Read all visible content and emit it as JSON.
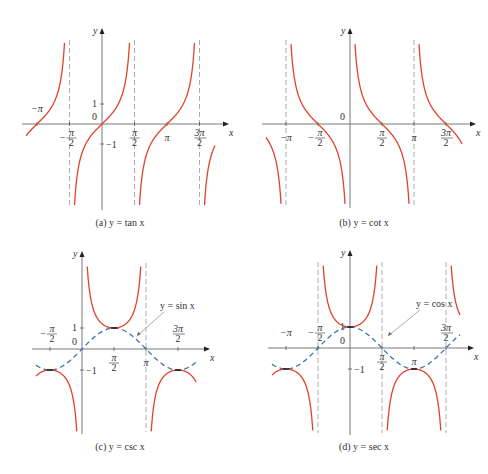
{
  "colors": {
    "curve": "#e0432a",
    "dashed_curve": "#3a6fb0",
    "axis": "#555555",
    "asymptote": "#999999",
    "extremum_mark": "#222222"
  },
  "panels": [
    {
      "id": "a",
      "caption": "(a) y = tan x",
      "func": "tan",
      "origin": [
        102,
        124
      ],
      "unit_x_half_pi": 32.5,
      "unit_y": 20,
      "x_range_px": [
        26,
        215
      ],
      "y_top": 40,
      "y_bottom": 208,
      "asymptotes": [
        -1.5708,
        1.5708,
        4.7124
      ],
      "x_ticks": [
        {
          "label": "−π",
          "x": -3.1416,
          "pos": "above"
        },
        {
          "label": "−π/2",
          "x": -1.5708,
          "pos": "below"
        },
        {
          "label": "π/2",
          "x": 1.5708,
          "pos": "below"
        },
        {
          "label": "π",
          "x": 3.1416,
          "pos": "below"
        },
        {
          "label": "3π/2",
          "x": 4.7124,
          "pos": "below"
        }
      ],
      "y_ticks": [
        {
          "label": "1",
          "y": 1
        },
        {
          "label": "−1",
          "y": -1
        }
      ],
      "zero_label": "0",
      "axis_labels": {
        "x": "x",
        "y": "y"
      },
      "caption_pos": [
        120,
        226
      ]
    },
    {
      "id": "b",
      "caption": "(b) y = cot x",
      "func": "cot",
      "origin": [
        350,
        124
      ],
      "unit_x_half_pi": 32,
      "unit_y": 20,
      "x_range_px": [
        266,
        462
      ],
      "y_top": 40,
      "y_bottom": 206,
      "asymptotes": [
        -3.1416,
        3.1416
      ],
      "x_ticks": [
        {
          "label": "−π",
          "x": -3.1416,
          "pos": "below"
        },
        {
          "label": "−π/2",
          "x": -1.5708,
          "pos": "below"
        },
        {
          "label": "π/2",
          "x": 1.5708,
          "pos": "below"
        },
        {
          "label": "π",
          "x": 3.1416,
          "pos": "below"
        },
        {
          "label": "3π/2",
          "x": 4.7124,
          "pos": "below"
        }
      ],
      "y_ticks": [],
      "zero_label": "0",
      "axis_labels": {
        "x": "x",
        "y": "y"
      },
      "caption_pos": [
        364,
        226
      ]
    },
    {
      "id": "c",
      "caption": "(c) y = csc x",
      "func": "csc",
      "companion": {
        "func": "sin",
        "label": "y = sin x"
      },
      "origin": [
        82,
        349
      ],
      "unit_x_half_pi": 32,
      "unit_y": 21,
      "x_range_px": [
        36,
        196
      ],
      "y_top": 263,
      "y_bottom": 432,
      "asymptotes": [
        3.1416
      ],
      "x_ticks": [
        {
          "label": "−π/2",
          "x": -1.5708,
          "pos": "above"
        },
        {
          "label": "π/2",
          "x": 1.5708,
          "pos": "below"
        },
        {
          "label": "π",
          "x": 3.1416,
          "pos": "below"
        },
        {
          "label": "3π/2",
          "x": 4.7124,
          "pos": "above"
        }
      ],
      "y_ticks": [
        {
          "label": "1",
          "y": 1
        },
        {
          "label": "−1",
          "y": -1
        }
      ],
      "zero_label": "0",
      "axis_labels": {
        "x": "x",
        "y": "y"
      },
      "caption_pos": [
        120,
        450
      ]
    },
    {
      "id": "d",
      "caption": "(d) y = sec x",
      "func": "sec",
      "companion": {
        "func": "cos",
        "label": "y = cos x"
      },
      "origin": [
        350,
        348
      ],
      "unit_x_half_pi": 32,
      "unit_y": 21,
      "x_range_px": [
        272,
        460
      ],
      "y_top": 262,
      "y_bottom": 433,
      "asymptotes": [
        -1.5708,
        1.5708,
        4.7124
      ],
      "x_ticks": [
        {
          "label": "−π",
          "x": -3.1416,
          "pos": "above"
        },
        {
          "label": "−π/2",
          "x": -1.5708,
          "pos": "above"
        },
        {
          "label": "π/2",
          "x": 1.5708,
          "pos": "below"
        },
        {
          "label": "π",
          "x": 3.1416,
          "pos": "below"
        },
        {
          "label": "3π/2",
          "x": 4.7124,
          "pos": "above"
        }
      ],
      "y_ticks": [
        {
          "label": "1",
          "y": 1
        },
        {
          "label": "−1",
          "y": -1
        }
      ],
      "zero_label": "0",
      "axis_labels": {
        "x": "x",
        "y": "y"
      },
      "caption_pos": [
        364,
        450
      ]
    }
  ],
  "chart_data": [
    {
      "type": "line",
      "title": "(a) y = tan x",
      "xlabel": "x",
      "ylabel": "y",
      "series": [
        {
          "name": "tan x",
          "x": [
            -3.1416,
            -0.7854,
            0,
            0.7854,
            3.1416
          ],
          "values": [
            0,
            -1,
            0,
            1,
            0
          ]
        }
      ],
      "asymptotes_x": [
        "−π/2",
        "π/2",
        "3π/2"
      ],
      "x_tick_labels": [
        "−π",
        "−π/2",
        "π/2",
        "π",
        "3π/2"
      ],
      "y_tick_labels": [
        "1",
        "−1"
      ],
      "grid": false
    },
    {
      "type": "line",
      "title": "(b) y = cot x",
      "xlabel": "x",
      "ylabel": "y",
      "series": [
        {
          "name": "cot x",
          "x": [
            -1.5708,
            1.5708,
            4.7124
          ],
          "values": [
            0,
            0,
            0
          ]
        }
      ],
      "asymptotes_x": [
        "−π",
        "0",
        "π"
      ],
      "x_tick_labels": [
        "−π",
        "−π/2",
        "π/2",
        "π",
        "3π/2"
      ],
      "grid": false
    },
    {
      "type": "line",
      "title": "(c) y = csc x",
      "xlabel": "x",
      "ylabel": "y",
      "series": [
        {
          "name": "csc x",
          "x": [
            -1.5708,
            1.5708,
            4.7124
          ],
          "values": [
            -1,
            1,
            -1
          ]
        },
        {
          "name": "y = sin x (dashed)",
          "x": [
            -1.5708,
            0,
            1.5708,
            3.1416,
            4.7124
          ],
          "values": [
            -1,
            0,
            1,
            0,
            -1
          ]
        }
      ],
      "asymptotes_x": [
        "0",
        "π"
      ],
      "x_tick_labels": [
        "−π/2",
        "π/2",
        "π",
        "3π/2"
      ],
      "y_tick_labels": [
        "1",
        "−1"
      ],
      "annotations": [
        "y = sin x"
      ],
      "grid": false
    },
    {
      "type": "line",
      "title": "(d) y = sec x",
      "xlabel": "x",
      "ylabel": "y",
      "series": [
        {
          "name": "sec x",
          "x": [
            -3.1416,
            0,
            3.1416
          ],
          "values": [
            -1,
            1,
            -1
          ]
        },
        {
          "name": "y = cos x (dashed)",
          "x": [
            -3.1416,
            -1.5708,
            0,
            1.5708,
            3.1416,
            4.7124
          ],
          "values": [
            -1,
            0,
            1,
            0,
            -1,
            0
          ]
        }
      ],
      "asymptotes_x": [
        "−π/2",
        "π/2",
        "3π/2"
      ],
      "x_tick_labels": [
        "−π",
        "−π/2",
        "π/2",
        "π",
        "3π/2"
      ],
      "y_tick_labels": [
        "1",
        "−1"
      ],
      "annotations": [
        "y = cos x"
      ],
      "grid": false
    }
  ]
}
